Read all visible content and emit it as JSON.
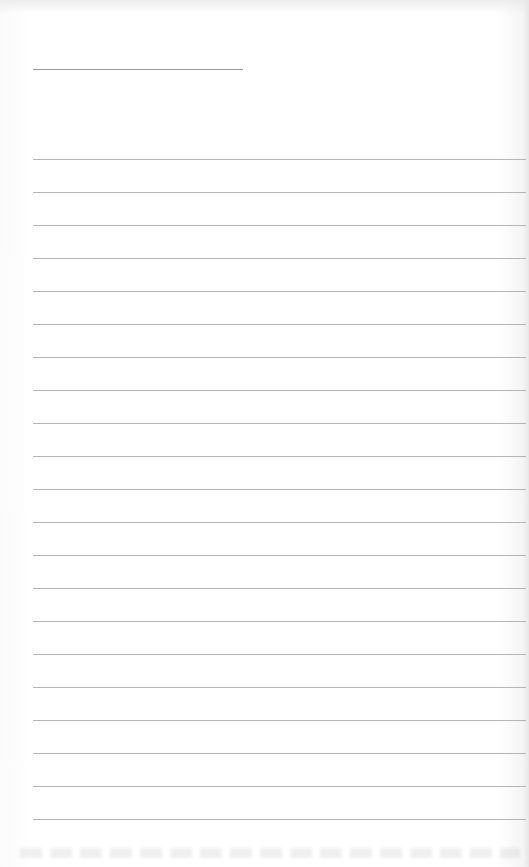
{
  "page": {
    "type": "lined-writing-sheet",
    "background": "#ffffff",
    "rule_color": "#a8a8a8"
  },
  "header_line": {
    "x1": 33,
    "x2": 243,
    "y": 69
  },
  "rules": {
    "count": 21,
    "x1": 33,
    "x2": 526,
    "first_y": 159,
    "spacing": 33
  }
}
